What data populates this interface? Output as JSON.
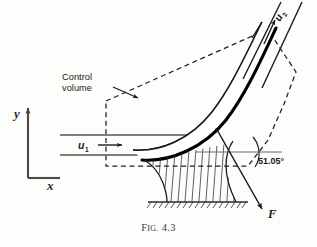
{
  "figure": {
    "caption_prefix": "F",
    "caption_smallcaps": "IG.",
    "caption_number": "4.3",
    "caption_full": "Fig. 4.3"
  },
  "axes": {
    "y_label": "y",
    "x_label": "x"
  },
  "labels": {
    "inlet_velocity": "u",
    "inlet_velocity_sub": "1",
    "outlet_velocity": "u",
    "outlet_velocity_sub": "2",
    "control_volume_line1": "Control",
    "control_volume_line2": "volume",
    "angle": "51.05°",
    "force": "F"
  },
  "colors": {
    "ink": "#1a1a1a",
    "mid_ink": "#555555",
    "background": "#fdfdfc",
    "hatch": "#2b2b2b",
    "dashed": "#1f1f1f"
  },
  "geometry_notes": {
    "deflection_angle_deg": 51.05,
    "jet_direction_in": "horizontal right",
    "jet_direction_out": "up and to the right"
  }
}
